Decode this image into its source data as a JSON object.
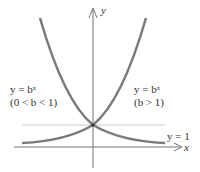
{
  "diagram": {
    "axes": {
      "x_label": "x",
      "y_label": "y"
    },
    "asymptote_label": "y = 1",
    "curves": [
      {
        "name": "decreasing",
        "equation": "y = bˣ",
        "condition": "(0 < b < 1)"
      },
      {
        "name": "increasing",
        "equation": "y = bˣ",
        "condition": "(b > 1)"
      }
    ],
    "colors": {
      "curve": "#7a7a7a",
      "axis": "#777777",
      "guide": "#cccccc",
      "text": "#333333"
    }
  }
}
